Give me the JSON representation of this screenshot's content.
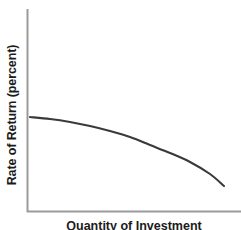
{
  "chart_data": {
    "type": "line",
    "title": "",
    "subtitle": "",
    "ylabel": "Rate of Return (percent)",
    "xlabel": "Quantity of Investment",
    "legend": [],
    "annotations": [],
    "grid": false,
    "axis_color": "#9a9a9a",
    "line_color": "#3a3a3a",
    "background": "#ffffff",
    "xlim": [
      0,
      100
    ],
    "ylim": [
      0,
      100
    ],
    "xticks": [],
    "yticks": [],
    "series": [
      {
        "name": "Rate of Return",
        "color": "#3a3a3a",
        "x": [
          0,
          10,
          20,
          30,
          40,
          50,
          60,
          70,
          80,
          90,
          92
        ],
        "y": [
          52,
          51,
          50,
          48,
          45,
          42,
          37,
          32,
          25,
          18,
          15
        ],
        "points_px": [
          [
            30,
            117
          ],
          [
            50,
            119
          ],
          [
            70,
            122
          ],
          [
            90,
            126
          ],
          [
            110,
            131
          ],
          [
            130,
            137
          ],
          [
            150,
            145
          ],
          [
            170,
            153
          ],
          [
            190,
            162
          ],
          [
            210,
            174
          ],
          [
            224,
            186
          ]
        ]
      }
    ],
    "axes_px": {
      "y_axis_x": 27,
      "y_axis_top": 9,
      "y_axis_bottom": 212,
      "x_axis_y": 212,
      "x_axis_left": 27,
      "x_axis_right": 241
    }
  }
}
